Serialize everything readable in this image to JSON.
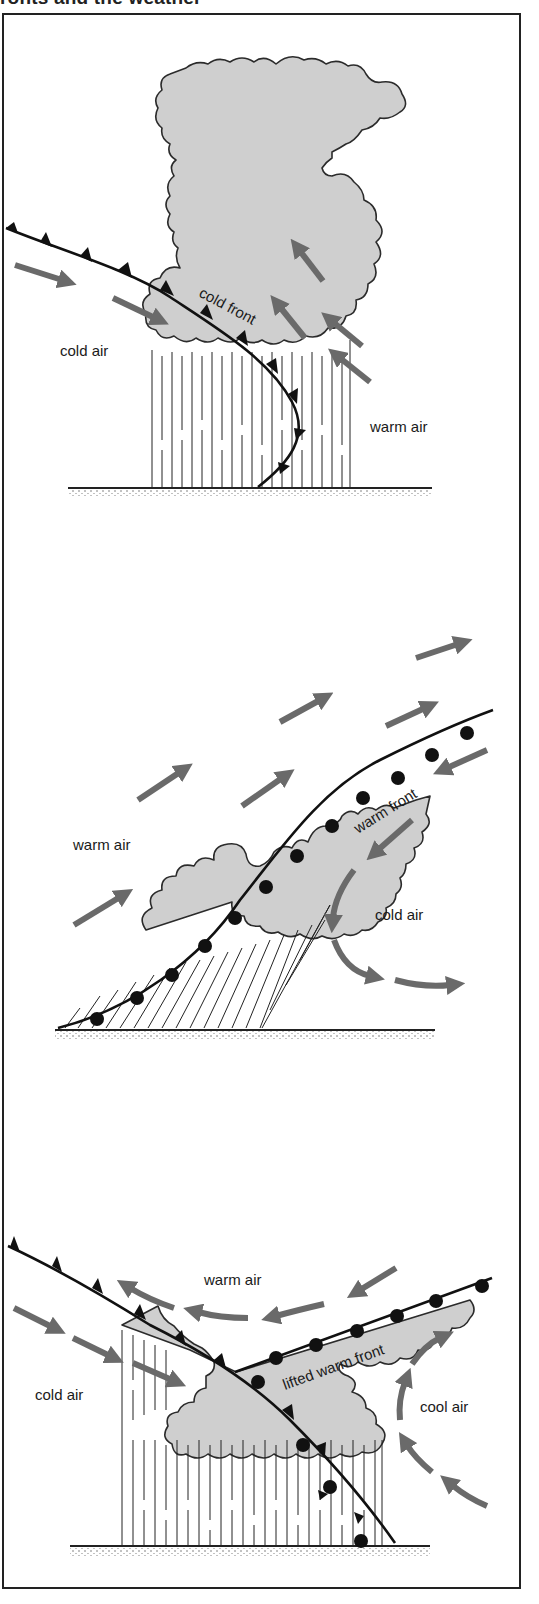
{
  "header": {
    "title": "ronts and the weather"
  },
  "colors": {
    "cloud_fill": "#cfcfcf",
    "arrow": "#6a6a6a",
    "front_line": "#111111",
    "frame_border": "#222222",
    "background": "#ffffff"
  },
  "panels": [
    {
      "id": "cold-front",
      "labels": {
        "front": "cold front",
        "left_air": "cold air",
        "right_air": "warm air"
      },
      "front_symbol": "triangles"
    },
    {
      "id": "warm-front",
      "labels": {
        "front": "warm front",
        "left_air": "warm air",
        "right_air": "cold air"
      },
      "front_symbol": "semicircles"
    },
    {
      "id": "occluded-front",
      "labels": {
        "front": "lifted warm front",
        "left_air": "cold air",
        "top_air": "warm air",
        "right_air": "cool air"
      },
      "front_symbol": "triangles-and-semicircles"
    }
  ]
}
